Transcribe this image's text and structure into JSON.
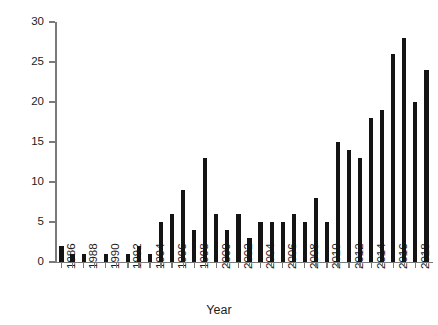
{
  "chart_data": {
    "type": "bar",
    "title": "",
    "subtitle": "",
    "xlabel": "Year",
    "ylabel": "",
    "xlim": [
      1985.4,
      2019.6
    ],
    "ylim": [
      0,
      30
    ],
    "grid": false,
    "legend": null,
    "bar_color": "#141414",
    "axis_color": "#7a7a7a",
    "y_ticks": [
      0,
      5,
      10,
      15,
      20,
      25,
      30
    ],
    "y_tick_labels": [
      "0",
      "5",
      "10",
      "15",
      "20",
      "25",
      "30"
    ],
    "x_tick_labels": [
      "1986",
      "1988",
      "1990",
      "1992",
      "1994",
      "1996",
      "1998",
      "2000",
      "2002",
      "2004",
      "2006",
      "2008",
      "2010",
      "2012",
      "2014",
      "2016",
      "2018"
    ],
    "x_tick_label_step": 2,
    "categories": [
      "1986",
      "1987",
      "1988",
      "1989",
      "1990",
      "1991",
      "1992",
      "1993",
      "1994",
      "1995",
      "1996",
      "1997",
      "1998",
      "1999",
      "2000",
      "2001",
      "2002",
      "2003",
      "2004",
      "2005",
      "2006",
      "2007",
      "2008",
      "2009",
      "2010",
      "2011",
      "2012",
      "2013",
      "2014",
      "2015",
      "2016",
      "2017",
      "2018",
      "2019"
    ],
    "values": [
      2,
      1,
      1,
      0,
      1,
      0,
      1,
      2,
      1,
      5,
      6,
      9,
      4,
      13,
      6,
      4,
      6,
      3,
      5,
      5,
      5,
      6,
      5,
      8,
      5,
      15,
      14,
      13,
      18,
      19,
      26,
      28,
      20,
      24
    ]
  },
  "axis": {
    "x_title": "Year"
  }
}
